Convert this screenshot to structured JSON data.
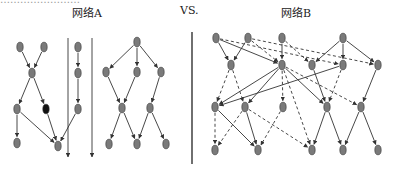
{
  "header": {
    "cut_text": "……………………"
  },
  "diagram": {
    "network_a_label": "网络A",
    "vs_label": "VS.",
    "network_b_label": "网络B",
    "colors": {
      "node_fill": "#7a7a7a",
      "node_stroke": "#333333",
      "highlight_node_fill": "#111111",
      "edge": "#333333",
      "divider": "#222222"
    },
    "network_a": {
      "nodes": [
        {
          "id": "a1",
          "x": 20,
          "y": 47
        },
        {
          "id": "a2",
          "x": 44,
          "y": 47
        },
        {
          "id": "a3",
          "x": 32,
          "y": 73
        },
        {
          "id": "a4",
          "x": 17,
          "y": 109
        },
        {
          "id": "a5",
          "x": 46,
          "y": 109,
          "highlight": true
        },
        {
          "id": "a6",
          "x": 17,
          "y": 143
        },
        {
          "id": "a7",
          "x": 58,
          "y": 146
        },
        {
          "id": "a8",
          "x": 78,
          "y": 47
        },
        {
          "id": "a9",
          "x": 78,
          "y": 73
        },
        {
          "id": "a10",
          "x": 78,
          "y": 109
        },
        {
          "id": "b1",
          "x": 137,
          "y": 42
        },
        {
          "id": "b2",
          "x": 106,
          "y": 72
        },
        {
          "id": "b3",
          "x": 137,
          "y": 72
        },
        {
          "id": "b4",
          "x": 161,
          "y": 72
        },
        {
          "id": "b5",
          "x": 122,
          "y": 108
        },
        {
          "id": "b6",
          "x": 150,
          "y": 108
        },
        {
          "id": "b7",
          "x": 109,
          "y": 144
        },
        {
          "id": "b7b",
          "x": 137,
          "y": 144
        },
        {
          "id": "b8",
          "x": 166,
          "y": 144
        }
      ],
      "edges": [
        [
          "a1",
          "a3"
        ],
        [
          "a2",
          "a3"
        ],
        [
          "a3",
          "a4"
        ],
        [
          "a3",
          "a5"
        ],
        [
          "a4",
          "a6"
        ],
        [
          "a4",
          "a7"
        ],
        [
          "a5",
          "a7"
        ],
        [
          "a8",
          "a9"
        ],
        [
          "a9",
          "a10"
        ],
        [
          "a10",
          "a7"
        ],
        [
          "b1",
          "b2"
        ],
        [
          "b1",
          "b3"
        ],
        [
          "b1",
          "b4"
        ],
        [
          "b2",
          "b5"
        ],
        [
          "b3",
          "b5"
        ],
        [
          "b4",
          "b6"
        ],
        [
          "b5",
          "b7"
        ],
        [
          "b5",
          "b7b"
        ],
        [
          "b6",
          "b7b"
        ],
        [
          "b6",
          "b8"
        ]
      ],
      "long_arrows": [
        {
          "x": 68,
          "y1": 38,
          "y2": 157
        },
        {
          "x": 92,
          "y1": 38,
          "y2": 157
        }
      ]
    },
    "network_b": {
      "nodes": [
        {
          "id": "n1",
          "x": 216,
          "y": 38
        },
        {
          "id": "n2",
          "x": 248,
          "y": 38
        },
        {
          "id": "n3",
          "x": 282,
          "y": 38
        },
        {
          "id": "n4",
          "x": 343,
          "y": 38
        },
        {
          "id": "n5",
          "x": 231,
          "y": 65
        },
        {
          "id": "n6",
          "x": 282,
          "y": 65
        },
        {
          "id": "n7",
          "x": 312,
          "y": 65
        },
        {
          "id": "n8",
          "x": 343,
          "y": 65
        },
        {
          "id": "n9",
          "x": 378,
          "y": 65
        },
        {
          "id": "n10",
          "x": 215,
          "y": 107
        },
        {
          "id": "n11",
          "x": 245,
          "y": 107
        },
        {
          "id": "n12",
          "x": 283,
          "y": 107
        },
        {
          "id": "n13",
          "x": 327,
          "y": 107
        },
        {
          "id": "n14",
          "x": 361,
          "y": 107
        },
        {
          "id": "n15",
          "x": 215,
          "y": 150
        },
        {
          "id": "n16",
          "x": 258,
          "y": 150
        },
        {
          "id": "n17",
          "x": 312,
          "y": 150
        },
        {
          "id": "n18",
          "x": 343,
          "y": 150
        },
        {
          "id": "n19",
          "x": 378,
          "y": 150
        }
      ],
      "solid_edges": [
        [
          "n1",
          "n5"
        ],
        [
          "n2",
          "n5"
        ],
        [
          "n1",
          "n6"
        ],
        [
          "n3",
          "n6"
        ],
        [
          "n4",
          "n7"
        ],
        [
          "n4",
          "n8"
        ],
        [
          "n4",
          "n9"
        ],
        [
          "n6",
          "n10"
        ],
        [
          "n6",
          "n11"
        ],
        [
          "n6",
          "n13"
        ],
        [
          "n8",
          "n10"
        ],
        [
          "n7",
          "n13"
        ],
        [
          "n9",
          "n14"
        ],
        [
          "n10",
          "n16"
        ],
        [
          "n11",
          "n16"
        ],
        [
          "n13",
          "n17"
        ],
        [
          "n13",
          "n18"
        ],
        [
          "n14",
          "n18"
        ],
        [
          "n14",
          "n19"
        ]
      ],
      "dashed_edges": [
        [
          "n1",
          "n8"
        ],
        [
          "n2",
          "n6"
        ],
        [
          "n2",
          "n9"
        ],
        [
          "n3",
          "n7"
        ],
        [
          "n5",
          "n10"
        ],
        [
          "n5",
          "n11"
        ],
        [
          "n6",
          "n12"
        ],
        [
          "n6",
          "n14"
        ],
        [
          "n8",
          "n13"
        ],
        [
          "n10",
          "n15"
        ],
        [
          "n11",
          "n15"
        ],
        [
          "n11",
          "n17"
        ],
        [
          "n12",
          "n16"
        ],
        [
          "n6",
          "n17"
        ]
      ]
    }
  }
}
